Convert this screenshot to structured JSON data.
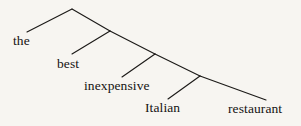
{
  "figure": {
    "type": "syntax-tree",
    "phrase": "the best inexpensive Italian restaurant",
    "background_color": "#f7f5f1",
    "line_color": "#1c1a18",
    "text_color": "#151311"
  },
  "leaves": [
    {
      "id": "leaf-the",
      "label": "the",
      "x": 13,
      "y": 34
    },
    {
      "id": "leaf-best",
      "label": "best",
      "x": 57,
      "y": 57
    },
    {
      "id": "leaf-inexpensive",
      "label": "inexpensive",
      "x": 84,
      "y": 79
    },
    {
      "id": "leaf-italian",
      "label": "Italian",
      "x": 145,
      "y": 101
    },
    {
      "id": "leaf-restaurant",
      "label": "restaurant",
      "x": 228,
      "y": 102
    }
  ],
  "nodes": [
    {
      "id": "node-root",
      "x": 72,
      "y": 9
    },
    {
      "id": "node-n2",
      "x": 110,
      "y": 31
    },
    {
      "id": "node-n3",
      "x": 155,
      "y": 54
    },
    {
      "id": "node-n4",
      "x": 200,
      "y": 76
    }
  ],
  "edges": [
    {
      "id": "edge-root-the",
      "from": "node-root",
      "to": "leaf-the",
      "x1": 72,
      "y1": 9,
      "x2": 27,
      "y2": 32
    },
    {
      "id": "edge-root-n2",
      "from": "node-root",
      "to": "node-n2",
      "x1": 72,
      "y1": 9,
      "x2": 110,
      "y2": 31
    },
    {
      "id": "edge-n2-best",
      "from": "node-n2",
      "to": "leaf-best",
      "x1": 110,
      "y1": 31,
      "x2": 72,
      "y2": 54
    },
    {
      "id": "edge-n2-n3",
      "from": "node-n2",
      "to": "node-n3",
      "x1": 110,
      "y1": 31,
      "x2": 155,
      "y2": 54
    },
    {
      "id": "edge-n3-inexpensive",
      "from": "node-n3",
      "to": "leaf-inexpensive",
      "x1": 155,
      "y1": 54,
      "x2": 122,
      "y2": 77
    },
    {
      "id": "edge-n3-n4",
      "from": "node-n3",
      "to": "node-n4",
      "x1": 155,
      "y1": 54,
      "x2": 200,
      "y2": 76
    },
    {
      "id": "edge-n4-italian",
      "from": "node-n4",
      "to": "leaf-italian",
      "x1": 200,
      "y1": 76,
      "x2": 168,
      "y2": 99
    },
    {
      "id": "edge-n4-restaurant",
      "from": "node-n4",
      "to": "leaf-restaurant",
      "x1": 200,
      "y1": 76,
      "x2": 266,
      "y2": 100
    }
  ]
}
